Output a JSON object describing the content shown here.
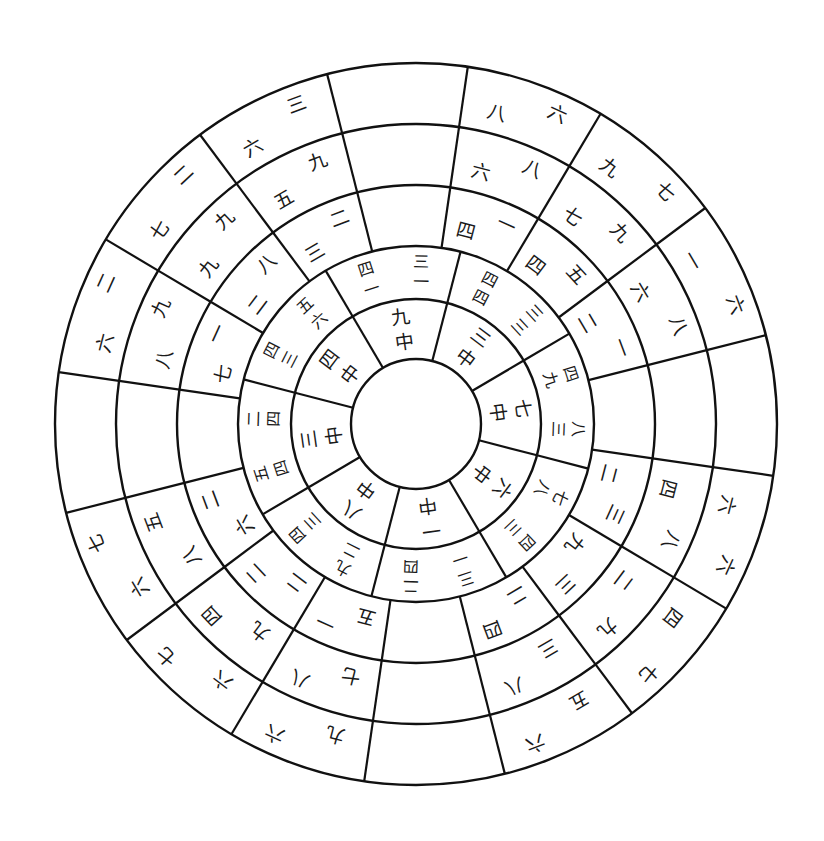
{
  "diagram": {
    "title": "",
    "type": "concentric-wheel",
    "center": [
      416,
      424
    ],
    "radii": [
      65,
      125,
      178,
      239,
      300,
      361
    ],
    "colors": {
      "line": "#111111",
      "text": "#1a1a1a",
      "background": "#ffffff"
    },
    "rings": [
      {
        "name": "ring-1",
        "inner": 65,
        "outer": 125,
        "sectors": 8,
        "rotation": -8,
        "cells": [
          {
            "dir": "N",
            "chars": [
              "中",
              "九"
            ]
          },
          {
            "dir": "NE",
            "chars": [
              "中",
              "三"
            ]
          },
          {
            "dir": "E",
            "chars": [
              "中",
              "七"
            ]
          },
          {
            "dir": "SE",
            "chars": [
              "中",
              "六"
            ]
          },
          {
            "dir": "S",
            "chars": [
              "中",
              "一"
            ]
          },
          {
            "dir": "SW",
            "chars": [
              "中",
              "八"
            ]
          },
          {
            "dir": "W",
            "chars": [
              "中",
              "三"
            ]
          },
          {
            "dir": "NW",
            "chars": [
              "中",
              "四"
            ]
          }
        ]
      },
      {
        "name": "ring-2",
        "inner": 125,
        "outer": 178,
        "sectors": 8,
        "rotation": -8,
        "cells": [
          {
            "dir": "N",
            "chars": [
              "四",
              "三",
              "一",
              "一"
            ]
          },
          {
            "dir": "NE",
            "chars": [
              "四",
              "三",
              "四",
              "三"
            ]
          },
          {
            "dir": "E",
            "chars": [
              "四",
              "八",
              "九",
              "三"
            ]
          },
          {
            "dir": "SE",
            "chars": [
              "七",
              "四",
              "八",
              "三"
            ]
          },
          {
            "dir": "S",
            "chars": [
              "三",
              "二",
              "一",
              "四"
            ]
          },
          {
            "dir": "SW",
            "chars": [
              "九",
              "四",
              "二",
              "三"
            ]
          },
          {
            "dir": "W",
            "chars": [
              "五",
              "二",
              "四",
              "四"
            ]
          },
          {
            "dir": "NW",
            "chars": [
              "四",
              "五",
              "三",
              "六"
            ]
          }
        ]
      },
      {
        "name": "ring-3",
        "inner": 178,
        "outer": 239,
        "sectors": 16,
        "rotation": -3,
        "cells": [
          {
            "dir": "N",
            "chars": []
          },
          {
            "dir": "NNE",
            "chars": [
              "四",
              "一"
            ]
          },
          {
            "dir": "NE",
            "chars": [
              "四",
              "五"
            ]
          },
          {
            "dir": "ENE",
            "chars": [
              "二",
              "一"
            ]
          },
          {
            "dir": "E",
            "chars": []
          },
          {
            "dir": "ESE",
            "chars": [
              "二",
              "三"
            ]
          },
          {
            "dir": "SE",
            "chars": [
              "九",
              "三"
            ]
          },
          {
            "dir": "SSE",
            "chars": [
              "二",
              "四"
            ]
          },
          {
            "dir": "S",
            "chars": []
          },
          {
            "dir": "SSW",
            "chars": [
              "五",
              "一"
            ]
          },
          {
            "dir": "SW",
            "chars": [
              "二",
              "二"
            ]
          },
          {
            "dir": "WSW",
            "chars": [
              "六",
              "二"
            ]
          },
          {
            "dir": "W",
            "chars": []
          },
          {
            "dir": "WNW",
            "chars": [
              "七",
              "一"
            ]
          },
          {
            "dir": "NW",
            "chars": [
              "二",
              "八"
            ]
          },
          {
            "dir": "NNW",
            "chars": [
              "三",
              "二"
            ]
          }
        ]
      },
      {
        "name": "ring-4",
        "inner": 239,
        "outer": 300,
        "sectors": 16,
        "rotation": -3,
        "cells": [
          {
            "dir": "N",
            "chars": []
          },
          {
            "dir": "NNE",
            "chars": [
              "六",
              "八"
            ]
          },
          {
            "dir": "NE",
            "chars": [
              "七",
              "九"
            ]
          },
          {
            "dir": "ENE",
            "chars": [
              "六",
              "八"
            ]
          },
          {
            "dir": "E",
            "chars": []
          },
          {
            "dir": "ESE",
            "chars": [
              "四",
              "八"
            ]
          },
          {
            "dir": "SE",
            "chars": [
              "二",
              "九"
            ]
          },
          {
            "dir": "SSE",
            "chars": [
              "三",
              "八"
            ]
          },
          {
            "dir": "S",
            "chars": []
          },
          {
            "dir": "SSW",
            "chars": [
              "七",
              "八"
            ]
          },
          {
            "dir": "SW",
            "chars": [
              "九",
              "四"
            ]
          },
          {
            "dir": "WSW",
            "chars": [
              "八",
              "五"
            ]
          },
          {
            "dir": "W",
            "chars": []
          },
          {
            "dir": "WNW",
            "chars": [
              "八",
              "九"
            ]
          },
          {
            "dir": "NW",
            "chars": [
              "九",
              "九"
            ]
          },
          {
            "dir": "NNW",
            "chars": [
              "五",
              "九"
            ]
          }
        ]
      },
      {
        "name": "ring-5",
        "inner": 300,
        "outer": 361,
        "sectors": 16,
        "rotation": -3,
        "cells": [
          {
            "dir": "N",
            "chars": []
          },
          {
            "dir": "NNE",
            "chars": [
              "八",
              "六"
            ]
          },
          {
            "dir": "NE",
            "chars": [
              "九",
              "七"
            ]
          },
          {
            "dir": "ENE",
            "chars": [
              "一",
              "六"
            ]
          },
          {
            "dir": "E",
            "chars": []
          },
          {
            "dir": "ESE",
            "chars": [
              "六",
              "六"
            ]
          },
          {
            "dir": "SE",
            "chars": [
              "四",
              "七"
            ]
          },
          {
            "dir": "SSE",
            "chars": [
              "五",
              "六"
            ]
          },
          {
            "dir": "S",
            "chars": []
          },
          {
            "dir": "SSW",
            "chars": [
              "九",
              "六"
            ]
          },
          {
            "dir": "SW",
            "chars": [
              "六",
              "七"
            ]
          },
          {
            "dir": "WSW",
            "chars": [
              "六",
              "七"
            ]
          },
          {
            "dir": "W",
            "chars": []
          },
          {
            "dir": "WNW",
            "chars": [
              "六",
              "二"
            ]
          },
          {
            "dir": "NW",
            "chars": [
              "七",
              "二"
            ]
          },
          {
            "dir": "NNW",
            "chars": [
              "六",
              "三"
            ]
          }
        ]
      }
    ]
  }
}
